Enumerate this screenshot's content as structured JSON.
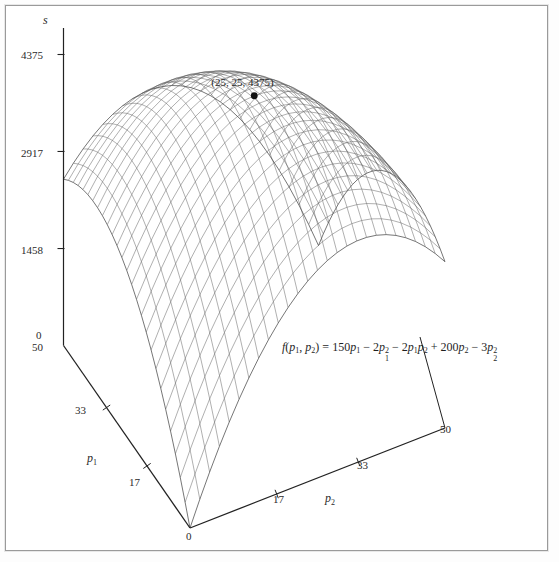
{
  "figure": {
    "background": "#ffffff",
    "frame_color": "#9a9a9a",
    "mesh_color": "#555555",
    "axis_color": "#222222",
    "text_color": "#2a2a2a"
  },
  "axes": {
    "vertical": {
      "name": "s",
      "ticks": [
        "4375",
        "2917",
        "1458",
        "0"
      ],
      "tick_values": [
        4375,
        2917,
        1458,
        0
      ]
    },
    "p1": {
      "name": "p",
      "subscript": "1",
      "ticks": [
        "50",
        "33",
        "17",
        "0"
      ],
      "tick_values": [
        50,
        33,
        17,
        0
      ],
      "range": [
        0,
        50
      ]
    },
    "p2": {
      "name": "p",
      "subscript": "2",
      "ticks": [
        "0",
        "17",
        "33",
        "50"
      ],
      "tick_values": [
        0,
        17,
        33,
        50
      ],
      "range": [
        0,
        50
      ]
    }
  },
  "annotations": {
    "peak_label": "(25, 25, 4375)",
    "peak_point": {
      "p1": 25,
      "p2": 25,
      "s": 4375
    }
  },
  "equation": {
    "lhs_f": "f",
    "lhs_open": "(",
    "lhs_p": "p",
    "lhs_sub1": "1",
    "lhs_comma": ", ",
    "lhs_p2": "p",
    "lhs_sub2": "2",
    "lhs_close": ")",
    "equals": "=",
    "t1_coef": "150",
    "t1_var": "p",
    "t1_sub": "1",
    "op1": "−",
    "t2_coef": "2",
    "t2_var": "p",
    "t2_sub": "1",
    "t2_sup": "2",
    "op2": "−",
    "t3_coef": "2",
    "t3_var1": "p",
    "t3_sub1": "1",
    "t3_var2": "p",
    "t3_sub2": "2",
    "op3": "+",
    "t4_coef": "200",
    "t4_var": "p",
    "t4_sub": "2",
    "op4": "−",
    "t5_coef": "3",
    "t5_var": "p",
    "t5_sub": "2",
    "t5_sup": "2",
    "plain": "f(p1, p2) = 150p1 − 2p1² − 2p1p2 + 200p2 − 3p2²"
  },
  "chart_data": {
    "type": "surface",
    "title": "",
    "xlabel": "p_1",
    "ylabel": "p_2",
    "zlabel": "s",
    "function": "f(p1,p2) = 150*p1 - 2*p1^2 - 2*p1*p2 + 200*p2 - 3*p2^2",
    "coefficients": {
      "p1": 150,
      "p1_squared": -2,
      "p1_p2": -2,
      "p2": 200,
      "p2_squared": -3
    },
    "xlim": [
      0,
      50
    ],
    "ylim": [
      0,
      50
    ],
    "zlim": [
      0,
      4375
    ],
    "x_ticks": [
      0,
      17,
      33,
      50
    ],
    "y_ticks": [
      0,
      17,
      33,
      50
    ],
    "z_ticks": [
      0,
      1458,
      2917,
      4375
    ],
    "grid": false,
    "legend": false,
    "mesh_divisions": 26,
    "maximum": {
      "p1": 25,
      "p2": 25,
      "s": 4375
    },
    "annotations": [
      {
        "text": "(25, 25, 4375)",
        "at": {
          "p1": 25,
          "p2": 25,
          "s": 4375
        }
      }
    ],
    "corner_values": [
      {
        "p1": 0,
        "p2": 0,
        "s": 0
      },
      {
        "p1": 50,
        "p2": 0,
        "s": 2500
      },
      {
        "p1": 0,
        "p2": 50,
        "s": 2500
      },
      {
        "p1": 50,
        "p2": 50,
        "s": 0
      }
    ]
  }
}
